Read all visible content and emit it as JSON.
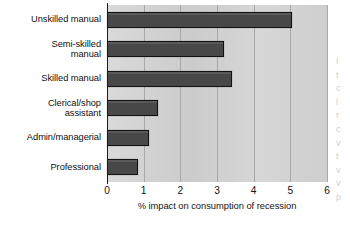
{
  "chart_data": {
    "type": "bar",
    "orientation": "horizontal",
    "title": "",
    "subtitle": "",
    "xlabel": "% impact on consumption of recession",
    "ylabel": "",
    "xlim": [
      0,
      6
    ],
    "xticks": [
      "0",
      "1",
      "2",
      "3",
      "4",
      "5",
      "6"
    ],
    "grid": true,
    "legend": false,
    "legend_position": "none",
    "categories": [
      "Unskilled manual",
      "Semi-skilled manual",
      "Skilled manual",
      "Clerical/shop assistant",
      "Admin/managerial",
      "Professional"
    ],
    "category_label_lines": [
      [
        "Unskilled manual"
      ],
      [
        "Semi-skilled",
        "manual"
      ],
      [
        "Skilled manual"
      ],
      [
        "Clerical/shop",
        "assistant"
      ],
      [
        "Admin/managerial"
      ],
      [
        "Professional"
      ]
    ],
    "values": [
      5.05,
      3.2,
      3.4,
      1.4,
      1.15,
      0.85
    ]
  },
  "colors": {
    "bar_fill": "#484848",
    "bar_outline": "#111111",
    "plot_background": "#d2d2d2",
    "gridline": "#a8a8a8",
    "axis": "#1b1b1b",
    "text": "#141414",
    "page_background": "#ffffff"
  },
  "margin_bleed": {
    "lines": [
      "I",
      "t",
      "c",
      "l",
      "r",
      "c",
      "v",
      "t",
      "v",
      "v",
      "p"
    ]
  }
}
